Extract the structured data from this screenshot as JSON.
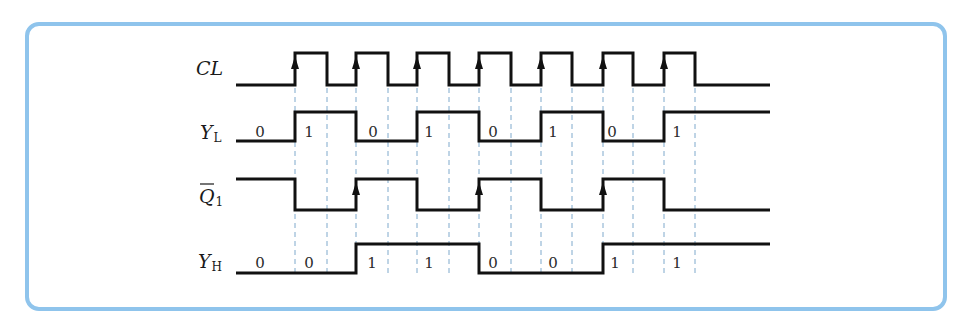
{
  "diagram": {
    "frame_color": "#8fc4ec",
    "signals": [
      {
        "id": "CL",
        "label_main": "CL",
        "label_sub": "",
        "overbar": false
      },
      {
        "id": "YL",
        "label_main": "Y",
        "label_sub": "L",
        "overbar": false,
        "bits": [
          "0",
          "1",
          "0",
          "1",
          "0",
          "1",
          "0",
          "1"
        ]
      },
      {
        "id": "Q1bar",
        "label_main": "Q",
        "label_sub": "1",
        "overbar": true
      },
      {
        "id": "YH",
        "label_main": "Y",
        "label_sub": "H",
        "overbar": false,
        "bits": [
          "0",
          "0",
          "1",
          "1",
          "0",
          "0",
          "1",
          "1"
        ]
      }
    ],
    "clock_rising_edges": 7,
    "waveforms": {
      "CL": [
        0,
        1,
        0,
        1,
        0,
        1,
        0,
        1,
        0,
        1,
        0,
        1,
        0,
        1,
        0,
        0
      ],
      "YL": [
        0,
        1,
        1,
        0,
        0,
        1,
        1,
        0,
        0,
        1,
        1,
        0,
        0,
        1,
        1,
        1
      ],
      "Q1bar": [
        1,
        0,
        0,
        1,
        1,
        0,
        0,
        1,
        1,
        0,
        0,
        1,
        1,
        0,
        0,
        0
      ],
      "YH": [
        0,
        0,
        0,
        1,
        1,
        1,
        1,
        0,
        0,
        0,
        0,
        1,
        1,
        1,
        1,
        1
      ]
    }
  }
}
